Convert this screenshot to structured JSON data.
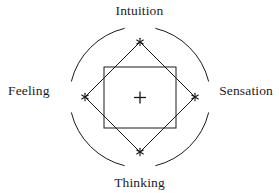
{
  "figure": {
    "background_color": "#ffffff",
    "stroke_color": "#1a1a1a"
  },
  "labels": {
    "north": "Intuition",
    "east": "Sensation",
    "south": "Thinking",
    "west": "Feeling"
  },
  "markers": {
    "center_glyph": "+",
    "vertex_glyph": "*",
    "center_name": "center-cross-marker",
    "vertex_names": [
      "north-asterisk-marker",
      "east-asterisk-marker",
      "south-asterisk-marker",
      "west-asterisk-marker"
    ]
  },
  "geometry": {
    "center_x": 140,
    "center_y": 97,
    "circle_radius": 72,
    "circle_arc_gap_degrees": 26,
    "diamond_radius": 55,
    "square_left": 104,
    "square_top": 67,
    "square_right": 176,
    "square_bottom": 128,
    "stroke_width": 1
  }
}
